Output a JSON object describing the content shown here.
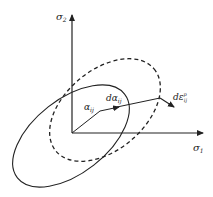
{
  "diagram": {
    "axes": {
      "x_label": "σ",
      "x_sub": "1",
      "y_label": "σ",
      "y_sub": "2"
    },
    "vectors": {
      "alpha_label": "α",
      "alpha_sub": "ij",
      "dalpha_label": "dα",
      "dalpha_sub": "ij",
      "depsilon_label": "dε",
      "depsilon_sub": "ij",
      "depsilon_sup": "p"
    },
    "curves": {
      "initial_yield_surface": "solid",
      "subsequent_yield_surface": "dashed"
    },
    "colors": {
      "stroke": "#222222",
      "background": "#ffffff"
    }
  }
}
